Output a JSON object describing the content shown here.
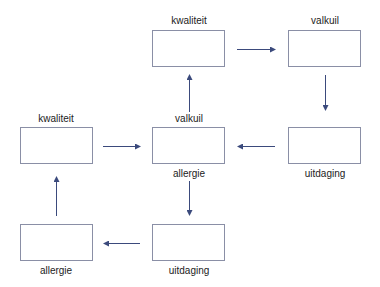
{
  "diagram": {
    "colors": {
      "arrow": "#3b4a7c",
      "box_border": "#8a8fa6",
      "text": "#222222"
    },
    "nodes": [
      {
        "id": "top-middle",
        "label": "kwaliteit",
        "label_pos": "above"
      },
      {
        "id": "top-right",
        "label": "valkuil",
        "label_pos": "above"
      },
      {
        "id": "middle-left",
        "label": "kwaliteit",
        "label_pos": "above"
      },
      {
        "id": "center",
        "label_above": "valkuil",
        "label_below": "allergie"
      },
      {
        "id": "middle-right",
        "label": "uitdaging",
        "label_pos": "below"
      },
      {
        "id": "bottom-left",
        "label": "allergie",
        "label_pos": "below"
      },
      {
        "id": "bottom-middle",
        "label": "uitdaging",
        "label_pos": "below"
      }
    ],
    "edges": [
      {
        "from": "center",
        "to": "top-middle",
        "direction": "up"
      },
      {
        "from": "top-middle",
        "to": "top-right",
        "direction": "right"
      },
      {
        "from": "top-right",
        "to": "middle-right",
        "direction": "down"
      },
      {
        "from": "middle-right",
        "to": "center",
        "direction": "left"
      },
      {
        "from": "middle-left",
        "to": "center",
        "direction": "right"
      },
      {
        "from": "center",
        "to": "bottom-middle",
        "direction": "down"
      },
      {
        "from": "bottom-middle",
        "to": "bottom-left",
        "direction": "left"
      },
      {
        "from": "bottom-left",
        "to": "middle-left",
        "direction": "up"
      }
    ]
  }
}
